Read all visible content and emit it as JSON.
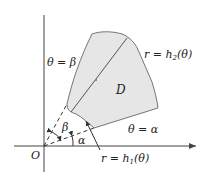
{
  "diagram": {
    "labels": {
      "theta_beta": "θ = β",
      "theta_alpha": "θ = α",
      "r_h2": "r = h",
      "r_h2_sub": "2",
      "r_h2_arg": "(θ)",
      "r_h1": "r = h",
      "r_h1_sub": "1",
      "r_h1_arg": "(θ)",
      "region": "D",
      "origin": "O",
      "beta": "β",
      "alpha": "α"
    },
    "colors": {
      "region_fill": "#e6e6e6",
      "stroke": "#333333",
      "axis": "#444444"
    }
  }
}
